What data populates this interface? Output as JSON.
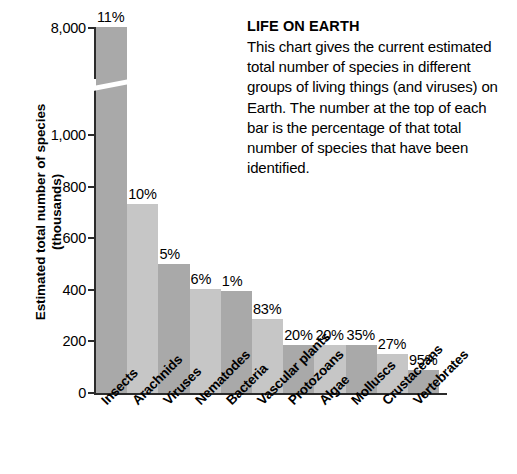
{
  "caption": {
    "title": "LIFE ON EARTH",
    "body": "This chart gives the current estimated total number of species in different groups of living things (and viruses) on Earth. The number at the top of each bar is the percentage of that total number of species that have been identified."
  },
  "axis": {
    "y_title_line1": "Estimated total number of species",
    "y_title_line2": "(thousands)",
    "y_ticks": [
      "8,000",
      "1,000",
      "800",
      "600",
      "400",
      "200",
      "0"
    ]
  },
  "chart_data": {
    "type": "bar",
    "title": "LIFE ON EARTH",
    "xlabel": "",
    "ylabel": "Estimated total number of species (thousands)",
    "ylim": [
      0,
      8000
    ],
    "y_tick_values": [
      8000,
      1000,
      800,
      600,
      400,
      200,
      0
    ],
    "axis_break": true,
    "axis_break_between": [
      1000,
      8000
    ],
    "grid": false,
    "legend": "none",
    "categories": [
      "Insects",
      "Arachnids",
      "Viruses",
      "Nematodes",
      "Bacteria",
      "Vascular plants",
      "Protozoans",
      "Algae",
      "Molluscs",
      "Crustaceans",
      "Vertebrates"
    ],
    "values": [
      8000,
      730,
      500,
      400,
      395,
      285,
      185,
      185,
      185,
      150,
      90
    ],
    "value_unit": "thousands of species",
    "data_labels": [
      "11%",
      "10%",
      "5%",
      "6%",
      "1%",
      "83%",
      "20%",
      "20%",
      "35%",
      "27%",
      "95%"
    ],
    "data_label_meaning": "percentage of total number of species that have been identified",
    "bar_colors": [
      "#a9a9a9",
      "#c6c6c6",
      "#a9a9a9",
      "#c6c6c6",
      "#a9a9a9",
      "#c6c6c6",
      "#a9a9a9",
      "#c6c6c6",
      "#a9a9a9",
      "#c6c6c6",
      "#a9a9a9"
    ]
  }
}
